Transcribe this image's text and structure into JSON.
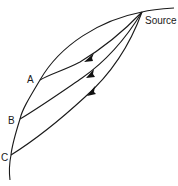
{
  "diagram": {
    "source_label": "Source",
    "points": [
      {
        "id": "A",
        "label": "A"
      },
      {
        "id": "B",
        "label": "B"
      },
      {
        "id": "C",
        "label": "C"
      }
    ],
    "colors": {
      "line": "#1a1a1a",
      "background": "#ffffff"
    }
  }
}
